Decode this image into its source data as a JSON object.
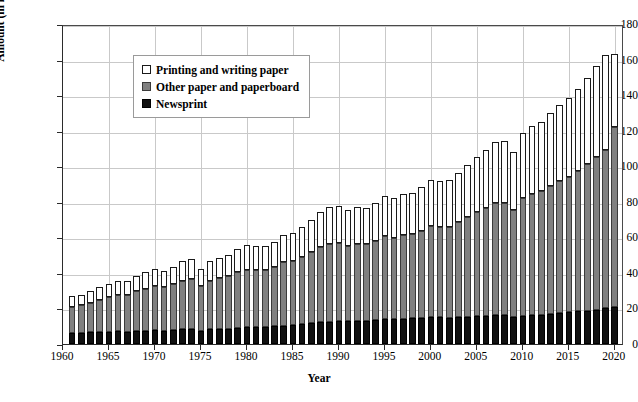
{
  "chart_data": {
    "type": "bar",
    "subtype": "stacked-vertical",
    "title": "",
    "xlabel": "Year",
    "ylabel": "Amount (in million metric tonnes)",
    "ylim": [
      0,
      180
    ],
    "ytick_step": 20,
    "yticks": [
      0,
      20,
      40,
      60,
      80,
      100,
      120,
      140,
      160,
      180
    ],
    "xlim": [
      1960,
      2021
    ],
    "xticks": [
      1960,
      1965,
      1970,
      1975,
      1980,
      1985,
      1990,
      1995,
      2000,
      2005,
      2010,
      2015,
      2020
    ],
    "xtick_labels": [
      "1960",
      "1965",
      "1970",
      "1975",
      "1980",
      "1985",
      "1990",
      "1995",
      "2000",
      "2005",
      "2010",
      "2015",
      "2020"
    ],
    "grid": "both",
    "legend_position": "upper-left-inside",
    "categories": [
      1961,
      1962,
      1963,
      1964,
      1965,
      1966,
      1967,
      1968,
      1969,
      1970,
      1971,
      1972,
      1973,
      1974,
      1975,
      1976,
      1977,
      1978,
      1979,
      1980,
      1981,
      1982,
      1983,
      1984,
      1985,
      1986,
      1987,
      1988,
      1989,
      1990,
      1991,
      1992,
      1993,
      1994,
      1995,
      1996,
      1997,
      1998,
      1999,
      2000,
      2001,
      2002,
      2003,
      2004,
      2005,
      2006,
      2007,
      2008,
      2009,
      2010,
      2011,
      2012,
      2013,
      2014,
      2015,
      2016,
      2017,
      2018,
      2019,
      2020
    ],
    "series": [
      {
        "name": "Newsprint",
        "color": "#111111",
        "values": [
          6.2,
          6.4,
          6.6,
          6.8,
          7.0,
          7.2,
          7.0,
          7.3,
          7.6,
          7.8,
          7.6,
          7.9,
          8.3,
          8.4,
          7.6,
          8.2,
          8.4,
          8.7,
          9.1,
          9.4,
          9.4,
          9.6,
          9.9,
          10.3,
          10.6,
          11.0,
          11.6,
          12.2,
          12.6,
          12.9,
          12.7,
          12.9,
          13.1,
          13.5,
          14.0,
          13.9,
          14.2,
          14.5,
          14.8,
          15.2,
          15.0,
          14.8,
          15.1,
          15.4,
          15.8,
          16.0,
          16.3,
          16.1,
          15.2,
          16.0,
          16.4,
          16.6,
          17.0,
          17.4,
          17.8,
          18.3,
          18.8,
          19.4,
          20.0,
          20.8
        ]
      },
      {
        "name": "Other paper and paperboard",
        "color": "#808080",
        "values": [
          14.9,
          15.4,
          16.6,
          18.0,
          19.2,
          20.5,
          20.8,
          22.3,
          23.5,
          24.7,
          24.3,
          25.6,
          27.4,
          27.9,
          24.9,
          27.4,
          28.6,
          29.6,
          31.4,
          32.5,
          32.4,
          32.3,
          33.6,
          35.6,
          36.2,
          37.7,
          40.0,
          42.4,
          43.9,
          43.9,
          42.6,
          43.4,
          43.2,
          44.5,
          46.6,
          45.7,
          47.1,
          47.2,
          48.7,
          51.1,
          50.8,
          51.3,
          53.5,
          56.0,
          58.3,
          60.7,
          63.2,
          63.4,
          60.2,
          66.0,
          68.2,
          69.4,
          71.9,
          74.4,
          76.3,
          79.0,
          82.3,
          86.0,
          89.4,
          101.0
        ]
      },
      {
        "name": "Printing and writing paper",
        "color": "#ffffff",
        "values": [
          5.8,
          6.0,
          6.4,
          7.0,
          7.4,
          7.9,
          7.8,
          8.6,
          9.2,
          9.6,
          9.4,
          10.1,
          11.0,
          11.3,
          9.6,
          10.9,
          11.5,
          12.0,
          13.0,
          13.6,
          13.5,
          13.4,
          14.1,
          15.3,
          15.8,
          16.9,
          18.2,
          19.8,
          20.7,
          20.9,
          20.1,
          20.6,
          20.4,
          21.3,
          22.8,
          22.3,
          23.3,
          23.5,
          24.7,
          26.2,
          25.9,
          26.2,
          27.6,
          29.3,
          30.9,
          32.6,
          34.4,
          34.8,
          32.8,
          36.6,
          38.2,
          39.1,
          40.9,
          42.8,
          44.2,
          46.1,
          48.4,
          50.9,
          53.2,
          41.2
        ]
      }
    ],
    "totals": [
      26.9,
      27.8,
      29.6,
      31.8,
      33.6,
      35.6,
      35.6,
      38.2,
      40.3,
      42.1,
      41.3,
      43.6,
      46.7,
      47.6,
      42.1,
      46.5,
      48.5,
      50.3,
      53.5,
      55.5,
      55.3,
      55.3,
      57.6,
      61.2,
      62.6,
      65.6,
      69.8,
      74.4,
      77.2,
      77.7,
      75.4,
      76.9,
      76.7,
      79.3,
      83.4,
      81.9,
      84.6,
      85.2,
      88.2,
      92.5,
      91.7,
      92.3,
      96.2,
      100.7,
      105.0,
      109.3,
      113.9,
      114.3,
      108.2,
      118.6,
      122.8,
      125.1,
      129.8,
      134.6,
      138.3,
      143.4,
      149.5,
      156.3,
      162.6,
      163.0
    ]
  },
  "legend": {
    "items": [
      {
        "label": "Printing and writing paper",
        "swatch": "white-square-swatch"
      },
      {
        "label": "Other paper and paperboard",
        "swatch": "gray-square-swatch"
      },
      {
        "label": "Newsprint",
        "swatch": "black-square-swatch"
      }
    ]
  },
  "axes": {
    "y_title": "Amount (in million metric tonnes)",
    "x_title": "Year"
  }
}
